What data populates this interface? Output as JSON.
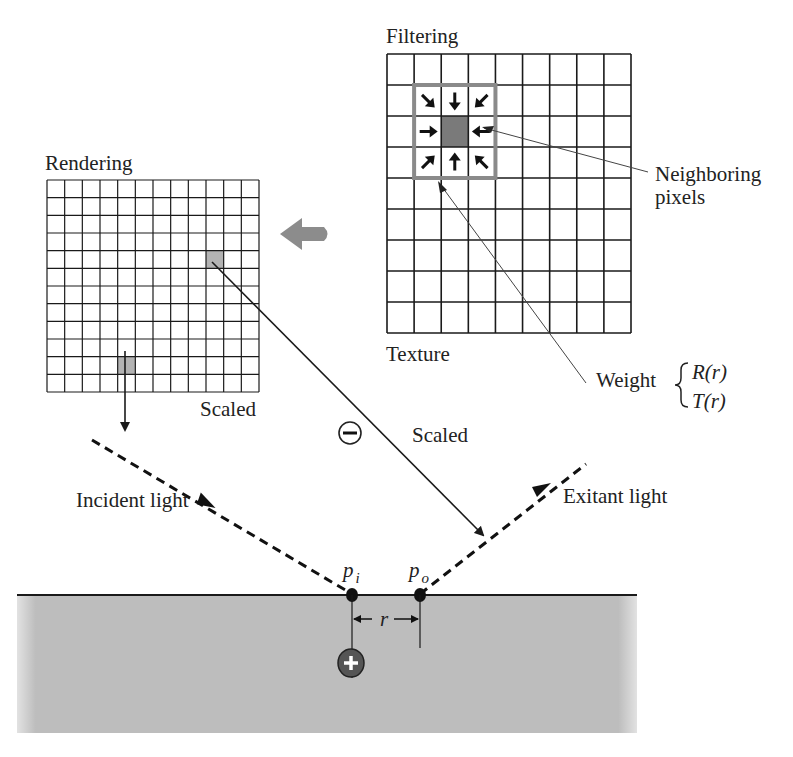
{
  "labels": {
    "filtering": "Filtering",
    "rendering": "Rendering",
    "texture": "Texture",
    "scaled_render": "Scaled",
    "scaled_line": "Scaled",
    "neighboring_1": "Neighboring",
    "neighboring_2": "pixels",
    "weight": "Weight",
    "weight_r": "R(r)",
    "weight_t": "T(r)",
    "incident": "Incident light",
    "exitant": "Exitant light",
    "p_i": "p",
    "p_i_sub": "i",
    "p_o": "p",
    "p_o_sub": "o",
    "r": "r"
  },
  "rendering_grid": {
    "x": 47,
    "y": 180,
    "size": 212,
    "cells": 12,
    "highlight": [
      [
        9,
        4
      ],
      [
        4,
        10
      ]
    ]
  },
  "texture_grid": {
    "x": 387,
    "y": 54,
    "w": 244,
    "h": 279,
    "cols": 9,
    "rows": 9,
    "kernel_col": 1,
    "kernel_row": 1
  },
  "colors": {
    "line": "#1a1a1a",
    "highlight_cell": "#b3b3b3",
    "kernel_border": "#8a8a8a",
    "kernel_center": "#7a7a7a",
    "big_arrow": "#8c8c8c",
    "surface": "#b8b8b8"
  }
}
